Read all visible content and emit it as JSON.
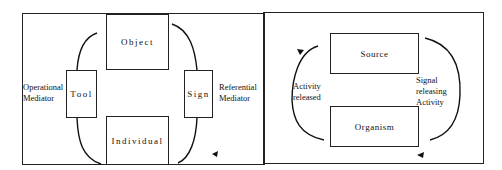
{
  "left_diagram": {
    "boxes": {
      "object": "Object",
      "tool": "Tool",
      "sign": "Sign",
      "individual": "Individual"
    },
    "labels": {
      "operational_line1": "Operational",
      "operational_line2": "Mediator",
      "referential_line1": "Referential",
      "referential_line2": "Mediator"
    }
  },
  "right_diagram": {
    "boxes": {
      "source": "Source",
      "organism": "Organism"
    },
    "labels": {
      "activity_line1": "Activity",
      "activity_line2": "released",
      "signal_line1": "Signal",
      "signal_line2": "releasing",
      "signal_line3": "Activity"
    }
  }
}
